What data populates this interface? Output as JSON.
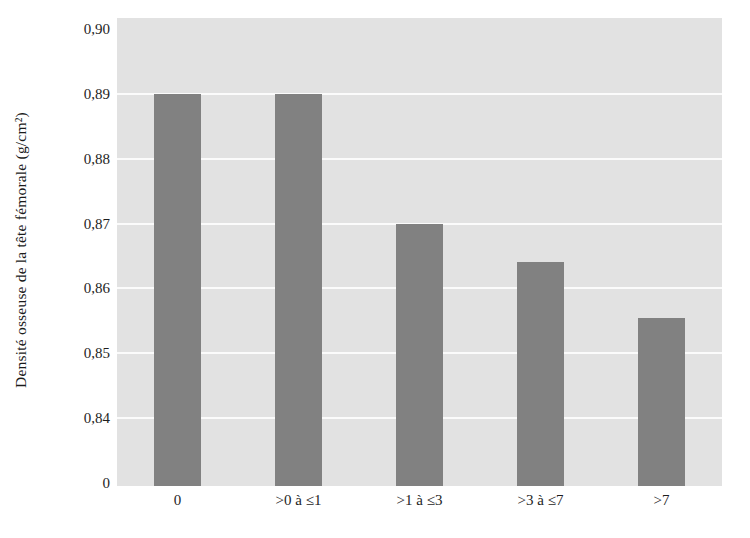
{
  "chart_data": {
    "type": "bar",
    "title": "",
    "subtitle": "",
    "xlabel": "",
    "ylabel": "Densité osseuse de la tête fémorale (g/cm²)",
    "categories": [
      "0",
      ">0 à ≤1",
      ">1 à ≤3",
      ">3 à ≤7",
      ">7"
    ],
    "values": [
      0.89,
      0.89,
      0.87,
      0.864,
      0.8554
    ],
    "ylim": [
      0.8345,
      0.9
    ],
    "y_ticks": [
      "0",
      "0,84",
      "0,85",
      "0,86",
      "0,87",
      "0,88",
      "0,89",
      "0,90"
    ],
    "y_tick_values": [
      0,
      0.84,
      0.85,
      0.86,
      0.87,
      0.88,
      0.89,
      0.9
    ],
    "y_axis_broken": true,
    "gridlines": [
      0.84,
      0.85,
      0.86,
      0.87,
      0.88,
      0.89
    ],
    "grid": true,
    "legend": [],
    "legend_position": "none",
    "annotations": [],
    "colors": {
      "bar_fill": "#818181",
      "plot_background": "#e2e2e2",
      "gridline": "#fbfbfb",
      "page_background": "#ffffff",
      "text": "#1e1e1e"
    }
  }
}
